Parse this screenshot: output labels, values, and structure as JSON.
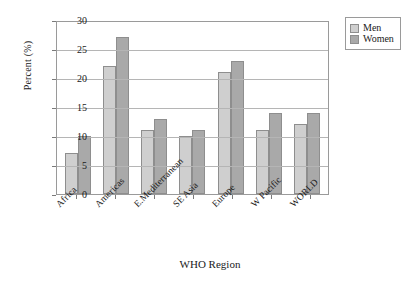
{
  "chart_data": {
    "type": "bar",
    "title": "",
    "xlabel": "WHO Region",
    "ylabel": "Percent (%)",
    "categories": [
      "Africa",
      "Americas",
      "E.Mediterranean",
      "SE Asia",
      "Europe",
      "W Pacific",
      "WORLD"
    ],
    "series": [
      {
        "name": "Men",
        "color": "#cfcfcf",
        "values": [
          7,
          22,
          11,
          10,
          21,
          11,
          12
        ]
      },
      {
        "name": "Women",
        "color": "#a9a9a9",
        "values": [
          10,
          27,
          13,
          11,
          23,
          14,
          14
        ]
      }
    ],
    "ylim": [
      0,
      30
    ],
    "yticks": [
      0,
      5,
      10,
      15,
      20,
      25,
      30
    ],
    "ytick_labels": [
      "0",
      "5",
      "10",
      "15",
      "20",
      "25",
      "30"
    ],
    "grid": true,
    "legend_position": "top-right",
    "legend_entries": [
      "Men",
      "Women"
    ]
  }
}
